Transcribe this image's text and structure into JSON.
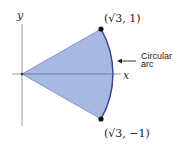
{
  "diagram": {
    "title": "",
    "axes": {
      "x_label": "x",
      "y_label": "y"
    },
    "points": [
      {
        "name": "top",
        "label": "(√3, 1)",
        "x": "√3",
        "y": "1"
      },
      {
        "name": "bottom",
        "label": "(√3, −1)",
        "x": "√3",
        "y": "−1"
      }
    ],
    "annotation": {
      "line1": "Circular",
      "line2": "arc"
    },
    "colors": {
      "fill": "#a9b7e3",
      "edge": "#34449a",
      "axis": "#888888",
      "point": "#111111"
    }
  }
}
